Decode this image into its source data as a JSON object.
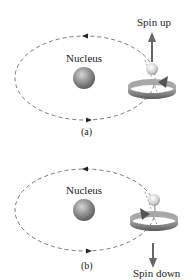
{
  "panels": [
    {
      "id": "a",
      "caption": "(a)",
      "nucleus_label": "Nucleus",
      "spin_label": "Spin up",
      "spin_direction": "up"
    },
    {
      "id": "b",
      "caption": "(b)",
      "nucleus_label": "Nucleus",
      "spin_label": "Spin down",
      "spin_direction": "down"
    }
  ],
  "colors": {
    "orbit": "#444444",
    "nucleus": "#8a8a8a",
    "electron": "#d8d8d8",
    "spin_band": "#8e8e8e",
    "arrow": "#666666"
  }
}
